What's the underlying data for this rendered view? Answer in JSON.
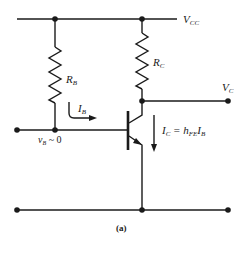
{
  "figure": {
    "caption": "(a)",
    "labels": {
      "vcc_main": "V",
      "vcc_sub": "CC",
      "rb_main": "R",
      "rb_sub": "B",
      "rc_main": "R",
      "rc_sub": "C",
      "vc_main": "V",
      "vc_sub": "C",
      "ib_main": "I",
      "ib_sub": "B",
      "vb_main": "v",
      "vb_sub": "B",
      "vb_rest": " ~ 0",
      "ic_main": "I",
      "ic_sub": "C",
      "ic_eq": " = h",
      "ic_hsub": "FE",
      "ic_i": "I",
      "ic_isub": "B"
    },
    "components": [
      {
        "type": "resistor",
        "name": "RB"
      },
      {
        "type": "resistor",
        "name": "RC"
      },
      {
        "type": "npn-transistor",
        "name": "Q"
      }
    ]
  }
}
